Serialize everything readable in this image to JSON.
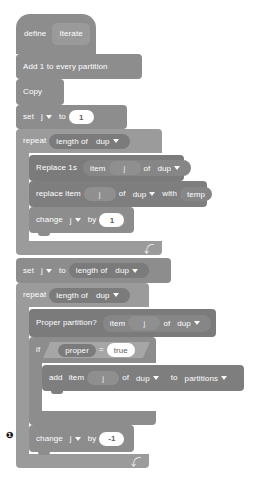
{
  "canvas": {
    "width": 267,
    "height": 486,
    "background": "#ffffff"
  },
  "palette": {
    "hat": "#8d8d8d",
    "control": "#9b9b9b",
    "control_inner": "#8d8d8d",
    "variable": "#8d8d8d",
    "list": "#7e7e7e",
    "operator": "#a3a3a3",
    "reporter_inner": "#7b7b7b",
    "input_white": "#ffffff",
    "input_text": "#5e5e5e",
    "block_text": "#ffffff"
  },
  "script": {
    "hat": {
      "keyword": "define",
      "procedure": "Iterate"
    },
    "blocks": [
      {
        "id": "add1",
        "label": "Add 1 to every partition"
      },
      {
        "id": "copy",
        "label": "Copy"
      }
    ],
    "set_j_1": {
      "keyword": "set",
      "variable": "j",
      "to": "to",
      "value": "1"
    },
    "repeat_1": {
      "keyword": "repeat",
      "times_reporter": {
        "label": "length of",
        "list": "dup"
      },
      "body": {
        "replace_1s": {
          "label": "Replace 1s",
          "item": "item",
          "index": "j",
          "of": "of",
          "list": "dup"
        },
        "replace_item": {
          "label": "replace item",
          "index": "j",
          "of": "of",
          "list": "dup",
          "with": "with",
          "value": "temp"
        },
        "change_j": {
          "keyword": "change",
          "variable": "j",
          "by": "by",
          "value": "1"
        }
      }
    },
    "set_j_len": {
      "keyword": "set",
      "variable": "j",
      "to": "to",
      "value_reporter": {
        "label": "length of",
        "list": "dup"
      }
    },
    "repeat_2": {
      "keyword": "repeat",
      "times_reporter": {
        "label": "length of",
        "list": "dup"
      },
      "body": {
        "proper_partition": {
          "label": "Proper partition?",
          "item": "item",
          "index": "j",
          "of": "of",
          "list": "dup"
        },
        "if_block": {
          "keyword": "if",
          "condition": {
            "left": "proper",
            "operator": "=",
            "right": "true"
          },
          "then": "then",
          "body": {
            "add_item": {
              "keyword": "add",
              "item": "item",
              "index": "j",
              "of": "of",
              "list": "dup",
              "to": "to",
              "target": "partitions"
            }
          }
        },
        "change_j": {
          "keyword": "change",
          "variable": "j",
          "by": "by",
          "value": "-1"
        }
      }
    },
    "marker": {
      "glyph": "❶",
      "text": "•"
    }
  },
  "icons": {
    "dropdown": "chevron-down-icon",
    "loop": "loop-arrow-icon"
  }
}
